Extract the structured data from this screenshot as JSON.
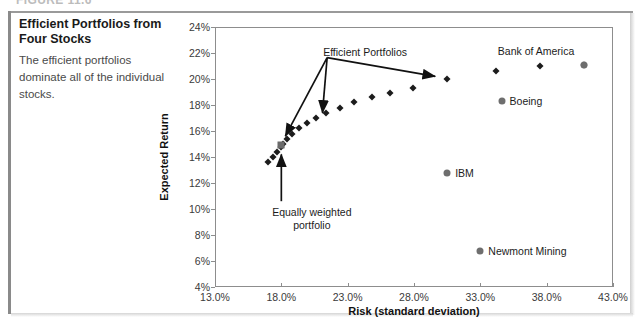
{
  "figure": {
    "number_label": "FIGURE 11.6",
    "caption_title": "Efficient Portfolios from Four Stocks",
    "caption_body": "The efficient portfolios dominate all of the individual stocks."
  },
  "chart_data": {
    "type": "scatter",
    "title": "Efficient Portfolios from Four Stocks",
    "xlabel": "Risk (standard deviation)",
    "ylabel": "Expected Return",
    "xlim": [
      13.0,
      43.0
    ],
    "ylim": [
      4,
      24
    ],
    "xticks": [
      "13.0%",
      "18.0%",
      "23.0%",
      "28.0%",
      "33.0%",
      "38.0%",
      "43.0%"
    ],
    "xtick_values": [
      13.0,
      18.0,
      23.0,
      28.0,
      33.0,
      38.0,
      43.0
    ],
    "yticks": [
      "4%",
      "6%",
      "8%",
      "10%",
      "12%",
      "14%",
      "16%",
      "18%",
      "20%",
      "22%",
      "24%"
    ],
    "ytick_values": [
      4,
      6,
      8,
      10,
      12,
      14,
      16,
      18,
      20,
      22,
      24
    ],
    "grid": false,
    "legend": "none",
    "series": [
      {
        "name": "Efficient Portfolios",
        "marker": "diamond",
        "color": "#1c1c1c",
        "points": [
          {
            "x": 17.0,
            "y": 13.6
          },
          {
            "x": 17.4,
            "y": 14.0
          },
          {
            "x": 17.7,
            "y": 14.4
          },
          {
            "x": 18.0,
            "y": 14.8
          },
          {
            "x": 18.1,
            "y": 15.0
          },
          {
            "x": 18.4,
            "y": 15.4
          },
          {
            "x": 18.8,
            "y": 15.8
          },
          {
            "x": 19.3,
            "y": 16.2
          },
          {
            "x": 19.9,
            "y": 16.6
          },
          {
            "x": 20.6,
            "y": 17.0
          },
          {
            "x": 21.4,
            "y": 17.4
          },
          {
            "x": 22.4,
            "y": 17.8
          },
          {
            "x": 23.5,
            "y": 18.2
          },
          {
            "x": 24.8,
            "y": 18.6
          },
          {
            "x": 26.2,
            "y": 18.9
          },
          {
            "x": 27.9,
            "y": 19.3
          },
          {
            "x": 30.5,
            "y": 20.0
          },
          {
            "x": 34.2,
            "y": 20.6
          },
          {
            "x": 37.5,
            "y": 21.0
          },
          {
            "x": 40.8,
            "y": 21.1
          }
        ]
      },
      {
        "name": "Equally weighted portfolio",
        "marker": "square",
        "color": "#6b6b6b",
        "points": [
          {
            "x": 18.0,
            "y": 14.9
          }
        ]
      },
      {
        "name": "Individual Stocks",
        "marker": "circle",
        "color": "#6e6e6e",
        "points": [
          {
            "x": 40.8,
            "y": 21.1,
            "label": "Bank of America"
          },
          {
            "x": 34.6,
            "y": 18.3,
            "label": "Boeing"
          },
          {
            "x": 30.5,
            "y": 12.8,
            "label": "IBM"
          },
          {
            "x": 33.0,
            "y": 6.8,
            "label": "Newmont Mining"
          }
        ]
      }
    ],
    "annotations": [
      {
        "text": "Efficient Portfolios",
        "x": 21.0,
        "y": 22.1
      },
      {
        "text": "Equally weighted portfolio",
        "x": 20.3,
        "y": 9.6
      }
    ]
  },
  "labels": {
    "bank_of_america": "Bank of America",
    "boeing": "Boeing",
    "ibm": "IBM",
    "newmont_mining": "Newmont Mining",
    "efficient_portfolios": "Efficient Portfolios",
    "equally_weighted_line1": "Equally weighted",
    "equally_weighted_line2": "portfolio"
  }
}
